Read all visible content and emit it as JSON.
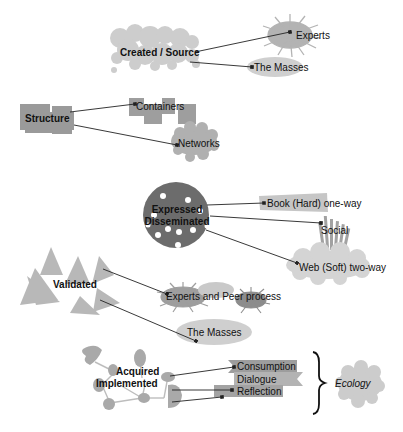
{
  "diagram": {
    "colors": {
      "light_gray": "#cfcfcf",
      "mid_gray": "#a9a9a9",
      "dark_gray": "#6f6f6f",
      "line": "#222222",
      "text": "#111111"
    },
    "groups": [
      {
        "id": "created",
        "label": "Created / Source",
        "shape": "bubble-cloud",
        "targets": [
          {
            "label": "Experts",
            "shape": "starburst"
          },
          {
            "label": "The Masses",
            "shape": "ellipse"
          }
        ]
      },
      {
        "id": "structure",
        "label": "Structure",
        "shape": "block-cluster",
        "targets": [
          {
            "label": "Containers",
            "shape": "squares"
          },
          {
            "label": "Networks",
            "shape": "scalloped-cloud"
          }
        ]
      },
      {
        "id": "expressed",
        "label_line1": "Expressed",
        "label_line2": "Disseminated",
        "shape": "dotted-circle",
        "targets": [
          {
            "label": "Book (Hard) one-way",
            "shape": "tilted-banner"
          },
          {
            "label": "Social",
            "shape": "bars"
          },
          {
            "label": "Web (Soft) two-way",
            "shape": "cloud"
          }
        ]
      },
      {
        "id": "validated",
        "label": "Validated",
        "shape": "triangles",
        "targets": [
          {
            "label": "Experts and Peer process",
            "shape": "starbursts"
          },
          {
            "label": "The Masses",
            "shape": "ellipse"
          }
        ]
      },
      {
        "id": "acquired",
        "label_line1": "Acquired",
        "label_line2": "Implemented",
        "shape": "node-network",
        "targets": [
          {
            "label": "Consumption",
            "shape": "ribbon"
          },
          {
            "label": "Dialogue",
            "shape": "ribbon"
          },
          {
            "label": "Reflection",
            "shape": "ribbon"
          }
        ],
        "brace_label": "Ecology"
      }
    ]
  }
}
